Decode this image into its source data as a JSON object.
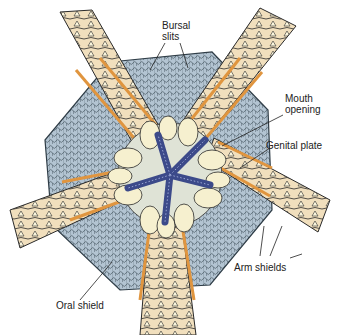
{
  "diagram": {
    "colors": {
      "disc": "#a9bccb",
      "disc_line": "#2f3d47",
      "arm": "#f1dfbd",
      "arm_edge": "#e0953f",
      "plate": "#f6f0cf",
      "jaw_star": "#3c4a8a",
      "outline": "#222222"
    },
    "labels": {
      "bursal_slits": [
        "Bursal",
        "slits"
      ],
      "mouth_opening": [
        "Mouth",
        "opening"
      ],
      "genital_plate": "Genital plate",
      "arm_shields": "Arm shields",
      "oral_shield": "Oral shield"
    }
  }
}
